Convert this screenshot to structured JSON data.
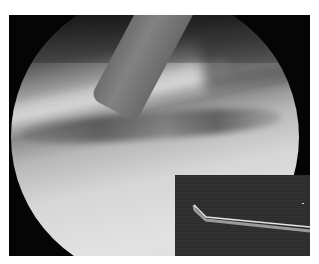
{
  "image": {
    "description": "Arthroscopic view with probe instrument; inset shows hook probe on dark background",
    "colors": {
      "background": "#ffffff",
      "frame": "#050505",
      "inset": "#2e2e2e",
      "probe": "#767676"
    }
  }
}
